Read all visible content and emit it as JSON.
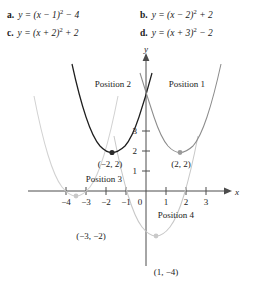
{
  "choices": [
    {
      "key": "a.",
      "equation": "y = (x − 1)² − 4"
    },
    {
      "key": "b.",
      "equation": "y = (x − 2)² + 2"
    },
    {
      "key": "c.",
      "equation": "y = (x + 2)² + 2"
    },
    {
      "key": "d.",
      "equation": "y = (x + 3)² − 2"
    }
  ],
  "graph": {
    "axis_x_label": "x",
    "axis_y_label": "y",
    "x_ticks": [
      "−4",
      "−3",
      "−2",
      "−1",
      "0",
      "1",
      "2",
      "3"
    ],
    "y_ticks": [
      "1",
      "2",
      "3"
    ],
    "position_labels": {
      "p1": "Position 1",
      "p2": "Position 2",
      "p3": "Position 3",
      "p4": "Position 4"
    },
    "vertex_labels": {
      "v1": "(2, 2)",
      "v2": "(−2, 2)",
      "v3": "(−3, −2)",
      "v4": "(1, −4)"
    },
    "colors": {
      "axis": "#4c4c4c",
      "curve1": "#8c8c8c",
      "curve2": "#1e1e1e",
      "curve3": "#d2d2d2",
      "curve4": "#c8c8c8"
    }
  },
  "chart_data": {
    "type": "line",
    "title": "",
    "xlabel": "x",
    "ylabel": "y",
    "xlim": [
      -4.8,
      3.8
    ],
    "ylim": [
      -5.2,
      7.0
    ],
    "grid": false,
    "legend": "inline-annotations",
    "x_ticks": [
      -4,
      -3,
      -2,
      -1,
      0,
      1,
      2,
      3
    ],
    "y_ticks": [
      1,
      2,
      3
    ],
    "series": [
      {
        "name": "Position 1",
        "equation": "y = (x - 2)^2 + 2",
        "vertex": [
          2,
          2
        ],
        "vertex_label": "(2, 2)",
        "color": "#8c8c8c",
        "x": [
          -0.2,
          0.5,
          1,
          1.5,
          2,
          2.5,
          3,
          3.5,
          3.8
        ],
        "values": [
          6.84,
          4.25,
          3,
          2.25,
          2,
          2.25,
          3,
          4.25,
          5.24
        ]
      },
      {
        "name": "Position 2",
        "equation": "y = (x + 2)^2 + 2",
        "vertex": [
          -2,
          2
        ],
        "vertex_label": "(−2, 2)",
        "color": "#1e1e1e",
        "x": [
          -4.2,
          -3.5,
          -3,
          -2.5,
          -2,
          -1.5,
          -1,
          -0.5,
          -0.2
        ],
        "values": [
          6.84,
          4.25,
          3,
          2.25,
          2,
          2.25,
          3,
          4.25,
          5.24
        ]
      },
      {
        "name": "Position 3",
        "equation": "y = (x + 3)^2 - 2",
        "vertex": [
          -3,
          -2
        ],
        "vertex_label": "(−3, −2)",
        "color": "#d2d2d2",
        "x": [
          -5.6,
          -5,
          -4.5,
          -4,
          -3.5,
          -3,
          -2.5,
          -2,
          -1.5,
          -1,
          -0.6
        ],
        "values": [
          4.76,
          2,
          0.25,
          -1,
          -1.75,
          -2,
          -1.75,
          -1,
          0.25,
          2,
          3.76
        ]
      },
      {
        "name": "Position 4",
        "equation": "y = (x - 1)^2 - 4",
        "vertex": [
          1,
          -4
        ],
        "vertex_label": "(1, −4)",
        "color": "#c8c8c8",
        "x": [
          -1.6,
          -1,
          -0.5,
          0,
          0.5,
          1,
          1.5,
          2,
          2.5,
          3,
          3.4
        ],
        "values": [
          2.76,
          0,
          -1.75,
          -3,
          -3.75,
          -4,
          -3.75,
          -3,
          -1.75,
          0,
          1.76
        ]
      }
    ]
  }
}
